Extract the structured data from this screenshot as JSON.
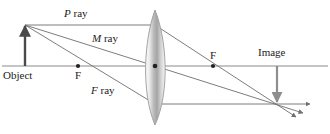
{
  "figure": {
    "labels": {
      "p_ray_italic": "P",
      "p_ray_rest": " ray",
      "m_ray_italic": "M",
      "m_ray_rest": " ray",
      "f_ray_italic": "F",
      "f_ray_rest": " ray",
      "object": "Object",
      "focal_left": "F",
      "focal_right": "F",
      "image": "Image"
    },
    "colors": {
      "ray_line": "#6e6e6e",
      "axis_line": "#8a8a8a",
      "object_arrow": "#4a4a4a",
      "image_arrow": "#8e8e8e",
      "lens_outline": "#9a9a9a",
      "lens_fill_light": "#f2f2f2",
      "lens_fill_dark": "#9c9c9c",
      "point_dot": "#222222",
      "text": "#1c1c1c",
      "background": "#ffffff"
    },
    "geometry": {
      "optical_axis_y": 66,
      "lens_center_x": 155,
      "lens_top_y": 10,
      "lens_bottom_y": 125,
      "object_base_x": 25,
      "object_tip_y": 24,
      "focal_left_x": 78,
      "focal_right_x": 213,
      "image_x": 277,
      "image_tip_y": 104,
      "p_ray_enter_y": 25,
      "f_ray_exit_y": 104
    },
    "elements": {
      "lens_name": "converging-lens",
      "object_arrow_name": "object-arrow",
      "image_arrow_name": "image-arrow",
      "axis_name": "optical-axis"
    }
  }
}
